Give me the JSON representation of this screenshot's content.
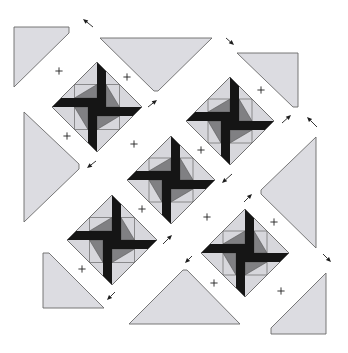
{
  "figure": {
    "type": "quilt-assembly-diagram",
    "width": 348,
    "height": 353,
    "background": "#ffffff"
  },
  "colors": {
    "setting_triangle_fill": "#dcdce1",
    "block_light_fill": "#d7d7dc",
    "block_medium_fill": "#808083",
    "blade_black": "#151515",
    "outline": "#6a6a6a",
    "seam": "#555555",
    "arrow": "#1e1e1e",
    "alignment_mark": "#222222"
  },
  "block_geometry": {
    "blade_width": 9,
    "layout": "on-point pinwheel blocks, diagonal rows"
  },
  "pinwheel_blocks": [
    {
      "position": "top-left",
      "cx": 97,
      "cy": 107,
      "r": 45
    },
    {
      "position": "top-right",
      "cx": 230,
      "cy": 121,
      "r": 44
    },
    {
      "position": "center",
      "cx": 171,
      "cy": 180,
      "r": 44
    },
    {
      "position": "bottom-left",
      "cx": 112,
      "cy": 240,
      "r": 45
    },
    {
      "position": "bottom-right",
      "cx": 245,
      "cy": 253,
      "r": 44
    }
  ],
  "setting_triangles": [
    {
      "position": "top-left-corner",
      "points": [
        [
          14,
          27
        ],
        [
          69,
          27
        ],
        [
          69,
          33
        ],
        [
          14,
          87
        ]
      ]
    },
    {
      "position": "top-side",
      "points": [
        [
          100,
          38
        ],
        [
          212,
          38
        ],
        [
          158,
          91
        ],
        [
          154,
          91
        ]
      ]
    },
    {
      "position": "top-right-corner",
      "points": [
        [
          237,
          53
        ],
        [
          298,
          53
        ],
        [
          298,
          107
        ],
        [
          293,
          107
        ]
      ]
    },
    {
      "position": "left-side",
      "points": [
        [
          24,
          112
        ],
        [
          79,
          164
        ],
        [
          79,
          169
        ],
        [
          24,
          222
        ]
      ]
    },
    {
      "position": "right-side",
      "points": [
        [
          316,
          137
        ],
        [
          316,
          248
        ],
        [
          261,
          194
        ],
        [
          261,
          190
        ]
      ]
    },
    {
      "position": "bottom-left-corner",
      "points": [
        [
          43,
          253
        ],
        [
          49,
          253
        ],
        [
          104,
          308
        ],
        [
          43,
          308
        ]
      ]
    },
    {
      "position": "bottom-side",
      "points": [
        [
          129,
          324
        ],
        [
          240,
          324
        ],
        [
          187,
          270
        ],
        [
          183,
          270
        ]
      ]
    },
    {
      "position": "bottom-right-corner",
      "points": [
        [
          326,
          273
        ],
        [
          326,
          334
        ],
        [
          271,
          334
        ],
        [
          271,
          328
        ]
      ]
    }
  ],
  "arrows": [
    {
      "direction": "up-left",
      "from": [
        93,
        27
      ],
      "to": [
        83,
        19
      ]
    },
    {
      "direction": "down-right",
      "from": [
        226,
        38
      ],
      "to": [
        234,
        45
      ]
    },
    {
      "direction": "up-right",
      "from": [
        282,
        123
      ],
      "to": [
        291,
        115
      ]
    },
    {
      "direction": "up-left",
      "from": [
        317,
        127
      ],
      "to": [
        307,
        117
      ]
    },
    {
      "direction": "up-right",
      "from": [
        148,
        107
      ],
      "to": [
        157,
        100
      ]
    },
    {
      "direction": "down-left",
      "from": [
        96,
        161
      ],
      "to": [
        87,
        168
      ]
    },
    {
      "direction": "up-right",
      "from": [
        163,
        244
      ],
      "to": [
        172,
        235
      ]
    },
    {
      "direction": "down-left",
      "from": [
        115,
        292
      ],
      "to": [
        107,
        300
      ]
    },
    {
      "direction": "down-left",
      "from": [
        232,
        174
      ],
      "to": [
        222,
        183
      ]
    },
    {
      "direction": "up-right",
      "from": [
        244,
        202
      ],
      "to": [
        252,
        194
      ]
    },
    {
      "direction": "down-left",
      "from": [
        192,
        256
      ],
      "to": [
        185,
        263
      ]
    },
    {
      "direction": "down-right",
      "from": [
        323,
        254
      ],
      "to": [
        331,
        262
      ]
    }
  ],
  "alignment_marks": [
    [
      59,
      71
    ],
    [
      127,
      77
    ],
    [
      67,
      136
    ],
    [
      134,
      144
    ],
    [
      261,
      90
    ],
    [
      201,
      150
    ],
    [
      142,
      209
    ],
    [
      82,
      269
    ],
    [
      207,
      217
    ],
    [
      274,
      222
    ],
    [
      214,
      283
    ],
    [
      281,
      291
    ]
  ]
}
